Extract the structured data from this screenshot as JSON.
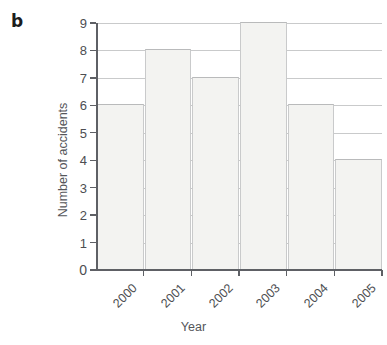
{
  "panel": {
    "label": "b"
  },
  "chart_data": {
    "type": "bar",
    "title": "",
    "xlabel": "Year",
    "ylabel": "Number of accidents",
    "categories": [
      "2000",
      "2001",
      "2002",
      "2003",
      "2004",
      "2005"
    ],
    "values": [
      6,
      8,
      7,
      9,
      6,
      4
    ],
    "ylim": [
      0,
      9
    ],
    "yticks": [
      "0",
      "1",
      "2",
      "3",
      "4",
      "5",
      "6",
      "7",
      "8",
      "9"
    ],
    "grid": "horizontal",
    "legend": "none",
    "bar_fill": "#f3f3f1",
    "bar_edge": "#c9cacb",
    "axis_color": "#5e6065",
    "xtick_rotation": -45
  }
}
